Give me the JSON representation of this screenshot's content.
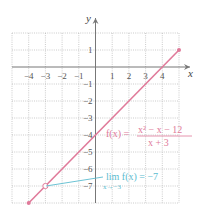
{
  "chart_data": {
    "type": "line",
    "title": "",
    "xlabel": "x",
    "ylabel": "y",
    "xlim": [
      -5,
      5
    ],
    "ylim": [
      -8,
      2
    ],
    "grid": true,
    "x_ticks": [
      -4,
      -3,
      -2,
      -1,
      1,
      2,
      3,
      4
    ],
    "x_tick_labels": [
      "−4",
      "−3",
      "−2",
      "−1",
      "1",
      "2",
      "3",
      "4"
    ],
    "y_ticks": [
      1,
      -1,
      -2,
      -3,
      -4,
      -5,
      -6,
      -7
    ],
    "y_tick_labels": [
      "1",
      "−1",
      "−2",
      "−3",
      "−4",
      "−5",
      "−6",
      "−7"
    ],
    "series": [
      {
        "name": "f(x) = (x^2 − x − 12)/(x + 3)",
        "color": "#e07a9a",
        "x": [
          -4,
          5
        ],
        "y": [
          -8,
          1
        ]
      }
    ],
    "open_points": [
      {
        "x": -3,
        "y": -7
      }
    ],
    "annotations": {
      "function": {
        "prefix": "f(x) = ",
        "numerator": "x² − x − 12",
        "denominator": "x + 3",
        "color": "#e07a9a"
      },
      "limit": {
        "text": "lim f(x) = −7",
        "subscript": "x→−3",
        "color": "#5bbccf"
      }
    }
  }
}
